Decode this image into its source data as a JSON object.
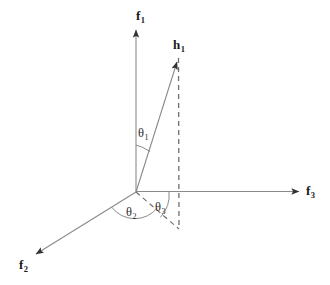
{
  "figure": {
    "type": "vector-diagram",
    "width": 330,
    "height": 285,
    "background_color": "#ffffff",
    "line_color": "#808080",
    "dashed_color": "#707070",
    "text_color": "#1a1a1a"
  },
  "axes": [
    {
      "id": "f1",
      "name": "f1-axis",
      "label_main": "f",
      "label_sub": "1",
      "direction": "vertical-up",
      "origin": [
        136,
        192
      ],
      "tip": [
        136,
        28
      ],
      "label_pos": [
        138,
        10
      ]
    },
    {
      "id": "f2",
      "name": "f2-axis",
      "label_main": "f",
      "label_sub": "2",
      "direction": "down-left",
      "origin": [
        136,
        192
      ],
      "tip": [
        33,
        256
      ],
      "label_pos": [
        18,
        258
      ]
    },
    {
      "id": "f3",
      "name": "f3-axis",
      "label_main": "f",
      "label_sub": "3",
      "direction": "right",
      "origin": [
        136,
        192
      ],
      "tip": [
        302,
        191
      ],
      "label_pos": [
        305,
        184
      ]
    }
  ],
  "vectors": [
    {
      "id": "h1",
      "name": "h1-vector",
      "label_main": "h",
      "label_sub": "1",
      "origin": [
        136,
        192
      ],
      "tip": [
        178,
        58
      ],
      "label_pos": [
        174,
        39
      ]
    }
  ],
  "projection_lines": [
    {
      "id": "vertical-drop",
      "name": "h1-vertical-projection",
      "style": "dashed",
      "from": [
        178,
        58
      ],
      "to": [
        179,
        229
      ]
    },
    {
      "id": "ground-projection",
      "name": "h1-ground-projection",
      "style": "dashed",
      "from": [
        136,
        192
      ],
      "to": [
        179,
        229
      ]
    }
  ],
  "angles": [
    {
      "id": "theta1",
      "name": "theta-1",
      "label_main": "θ",
      "label_sub": "1",
      "label_pos": [
        137,
        127
      ],
      "between": [
        "f1",
        "h1"
      ],
      "arc_radius": 47
    },
    {
      "id": "theta2",
      "name": "theta-2",
      "label_main": "θ",
      "label_sub": "2",
      "label_pos": [
        125,
        206
      ],
      "between": [
        "f2",
        "ground-projection"
      ],
      "arc_radius": 29
    },
    {
      "id": "theta3",
      "name": "theta-3",
      "label_main": "θ",
      "label_sub": "3",
      "label_pos": [
        155,
        201
      ],
      "between": [
        "ground-projection",
        "f3"
      ],
      "arc_radius": 33
    }
  ]
}
